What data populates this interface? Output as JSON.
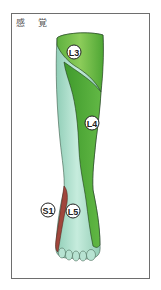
{
  "diagram": {
    "title": "感 覚",
    "regions": [
      {
        "id": "L3",
        "label": "L3",
        "color": "#7cc24e",
        "area": "anterior thigh / knee"
      },
      {
        "id": "L4",
        "label": "L4",
        "color": "#5ab13c",
        "area": "medial lower leg"
      },
      {
        "id": "L5",
        "label": "L5",
        "color": "#a8dcc8",
        "area": "anterolateral leg / dorsum of foot"
      },
      {
        "id": "S1",
        "label": "S1",
        "color": "#a0463c",
        "area": "lateral foot"
      }
    ],
    "colors": {
      "frame": "#6e6e6e",
      "skin_teal": "#a8dcc8",
      "green_light": "#7cc24e",
      "green_dark": "#4ea634",
      "red_brown": "#a0463c",
      "outline": "#1e3a1a"
    }
  }
}
